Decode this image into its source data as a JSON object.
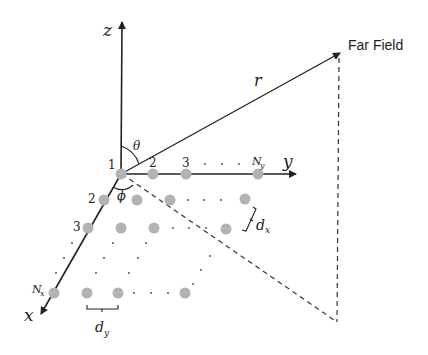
{
  "diagram": {
    "type": "planar-array-geometry",
    "far_field_label": "Far Field",
    "axes": {
      "x_label": "x",
      "y_label": "y",
      "z_label": "z"
    },
    "range_label": "r",
    "angles": {
      "theta": "θ",
      "phi": "ϕ"
    },
    "y_indices": [
      "1",
      "2",
      "3",
      "N",
      "y"
    ],
    "x_indices": [
      "2",
      "3",
      "N",
      "x"
    ],
    "spacing": {
      "dx_main": "d",
      "dx_sub": "x",
      "dy_main": "d",
      "dy_sub": "y"
    },
    "colors": {
      "element_fill": "#b3b3b3",
      "line": "#222222",
      "dashed": "#333333"
    }
  }
}
